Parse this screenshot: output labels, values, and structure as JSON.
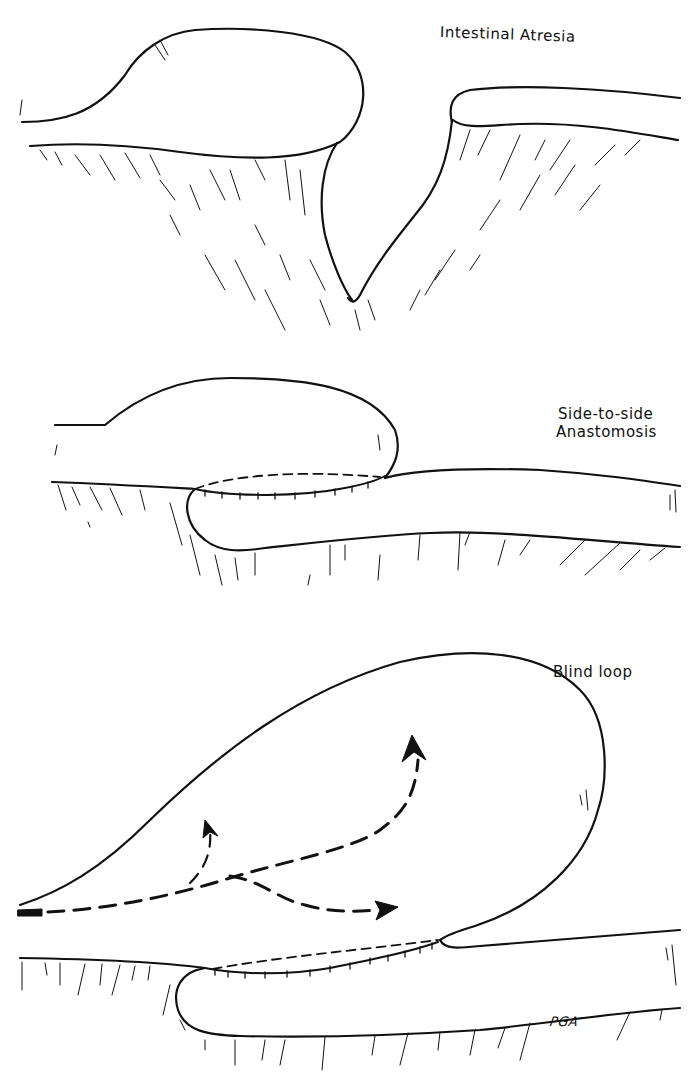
{
  "figure": {
    "panels": [
      {
        "id": "atresia",
        "label": "Intestinal Atresia",
        "description": "Dilated proximal blind-ending intestine separated from distal segment by a V-shaped mesenteric gap"
      },
      {
        "id": "anastomosis",
        "label_line1": "Side-to-side",
        "label_line2": "Anastomosis",
        "description": "Proximal and distal segments joined side-to-side with sutured anastomosis (dashed outline)"
      },
      {
        "id": "blind-loop",
        "label": "Blind loop",
        "description": "Enlarged blind loop with dashed arrows indicating intraluminal flow/stasis"
      }
    ],
    "artist_initials": "PGA",
    "colors": {
      "ink": "#111111",
      "background": "#ffffff"
    }
  }
}
